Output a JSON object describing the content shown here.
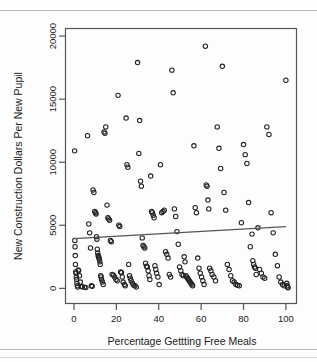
{
  "figure": {
    "background": "#fdfdfd",
    "frame_color": "#555555",
    "marker_color": "#222222",
    "line_color": "#555555"
  },
  "chart_data": {
    "type": "scatter",
    "title": "",
    "xlabel": "Percentage Gettting Free Meals",
    "ylabel": "New Construction Dollars Per New Pupil",
    "xlim": [
      -4,
      105
    ],
    "ylim": [
      -1200,
      20600
    ],
    "xticks": [
      0,
      20,
      40,
      60,
      80,
      100
    ],
    "yticks": [
      0,
      5000,
      10000,
      15000,
      20000
    ],
    "xtick_labels": [
      "0",
      "20",
      "40",
      "60",
      "80",
      "100"
    ],
    "ytick_labels": [
      "0",
      "5000",
      "10000",
      "15000",
      "20000"
    ],
    "grid": false,
    "legend": null,
    "marker": "open-circle",
    "marker_size": 4.4,
    "trendline": {
      "type": "linear-fit",
      "x_start": 0,
      "y_start": 3950,
      "x_end": 100,
      "y_end": 4900
    },
    "x": [
      0.3,
      0.4,
      0.5,
      0.6,
      0.7,
      0.8,
      1.0,
      1.1,
      1.2,
      1.4,
      1.6,
      1.8,
      2.0,
      2.2,
      2.6,
      3.0,
      3.4,
      4.0,
      5.0,
      5.6,
      6.4,
      7.0,
      7.4,
      7.8,
      8.2,
      8.6,
      9.0,
      9.4,
      9.8,
      10.2,
      10.4,
      10.6,
      10.8,
      11.0,
      11.2,
      11.4,
      11.6,
      11.8,
      12.0,
      12.2,
      12.4,
      12.6,
      12.8,
      13.0,
      13.4,
      13.8,
      14.2,
      14.6,
      15.0,
      15.6,
      16.0,
      16.4,
      16.8,
      17.2,
      17.6,
      18.0,
      18.6,
      19.2,
      19.8,
      20.4,
      20.8,
      21.2,
      21.6,
      22.0,
      22.4,
      22.8,
      23.2,
      23.8,
      24.2,
      24.6,
      25.0,
      25.4,
      25.8,
      26.2,
      26.6,
      27.0,
      27.6,
      28.2,
      28.8,
      29.4,
      30.0,
      30.6,
      31.0,
      31.4,
      31.8,
      32.2,
      32.6,
      33.0,
      33.4,
      33.8,
      34.2,
      34.6,
      35.0,
      35.4,
      35.8,
      36.2,
      36.6,
      37.0,
      37.4,
      37.8,
      38.2,
      38.6,
      39.0,
      39.6,
      40.2,
      40.8,
      41.4,
      42.0,
      42.6,
      43.2,
      43.8,
      44.4,
      45.0,
      45.6,
      46.2,
      46.8,
      47.4,
      48.0,
      48.6,
      49.2,
      49.8,
      50.4,
      51.0,
      51.6,
      52.0,
      52.4,
      52.8,
      53.2,
      53.6,
      54.0,
      54.4,
      54.8,
      55.2,
      55.6,
      56.0,
      56.6,
      57.2,
      57.8,
      58.4,
      59.0,
      59.6,
      60.2,
      60.8,
      61.4,
      62.0,
      62.4,
      62.8,
      63.2,
      63.6,
      64.0,
      64.6,
      65.2,
      66.0,
      66.8,
      67.6,
      68.4,
      69.2,
      70.0,
      70.8,
      71.6,
      72.4,
      73.2,
      74.0,
      74.8,
      75.6,
      76.4,
      77.2,
      78.0,
      79.0,
      80.0,
      80.8,
      81.6,
      82.4,
      83.2,
      84.0,
      84.4,
      84.8,
      85.2,
      85.6,
      86.0,
      86.8,
      87.6,
      88.4,
      89.2,
      90.0,
      91.0,
      92.0,
      93.0,
      94.0,
      95.0,
      96.0,
      96.8,
      97.6,
      98.4,
      99.2,
      100.0,
      100.4,
      100.6,
      100.8,
      101.0
    ],
    "y": [
      10900,
      3800,
      3300,
      2600,
      1900,
      1300,
      1200,
      900,
      700,
      400,
      200,
      100,
      1450,
      1400,
      1000,
      500,
      150,
      120,
      100,
      60,
      12100,
      5100,
      4400,
      3200,
      200,
      160,
      7800,
      7600,
      6100,
      6000,
      5900,
      4100,
      3900,
      3100,
      2800,
      2600,
      2500,
      2400,
      2300,
      2100,
      1900,
      1000,
      900,
      700,
      500,
      300,
      12400,
      12300,
      12800,
      6600,
      5600,
      5500,
      5400,
      3800,
      3700,
      1100,
      1050,
      900,
      700,
      600,
      15300,
      5000,
      4900,
      1300,
      1250,
      900,
      500,
      300,
      200,
      13500,
      9800,
      9600,
      1900,
      1000,
      800,
      600,
      400,
      250,
      200,
      100,
      17900,
      10700,
      13300,
      8500,
      8100,
      4000,
      3400,
      3300,
      3200,
      2000,
      1750,
      1700,
      1400,
      1000,
      700,
      8900,
      6100,
      6000,
      5800,
      5600,
      1800,
      1500,
      1200,
      900,
      300,
      9800,
      6000,
      6100,
      6200,
      2900,
      2700,
      2400,
      1100,
      900,
      17300,
      15500,
      6300,
      5700,
      4500,
      3500,
      1700,
      1400,
      1100,
      1000,
      2500,
      2100,
      1000,
      900,
      800,
      700,
      600,
      500,
      400,
      300,
      200,
      11300,
      6400,
      6000,
      2400,
      1600,
      1200,
      900,
      600,
      300,
      19200,
      8200,
      8100,
      7000,
      6300,
      1600,
      1400,
      1100,
      900,
      600,
      12800,
      11100,
      9500,
      17600,
      7600,
      6200,
      1900,
      1500,
      1000,
      600,
      500,
      300,
      250,
      200,
      5200,
      11400,
      10600,
      9900,
      6800,
      3300,
      4300,
      2200,
      1900,
      1700,
      1600,
      1100,
      4800,
      1500,
      1200,
      900,
      800,
      12800,
      12200,
      6000,
      4400,
      2700,
      1800,
      900,
      500,
      300,
      200,
      16500,
      400,
      200,
      100,
      50
    ]
  }
}
